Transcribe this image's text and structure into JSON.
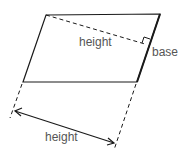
{
  "diagram": {
    "type": "parallelogram-geometry",
    "labels": {
      "height_inner": "height",
      "base": "base",
      "height_outer": "height"
    },
    "colors": {
      "stroke": "#1a1a1a",
      "text": "#555555"
    }
  }
}
